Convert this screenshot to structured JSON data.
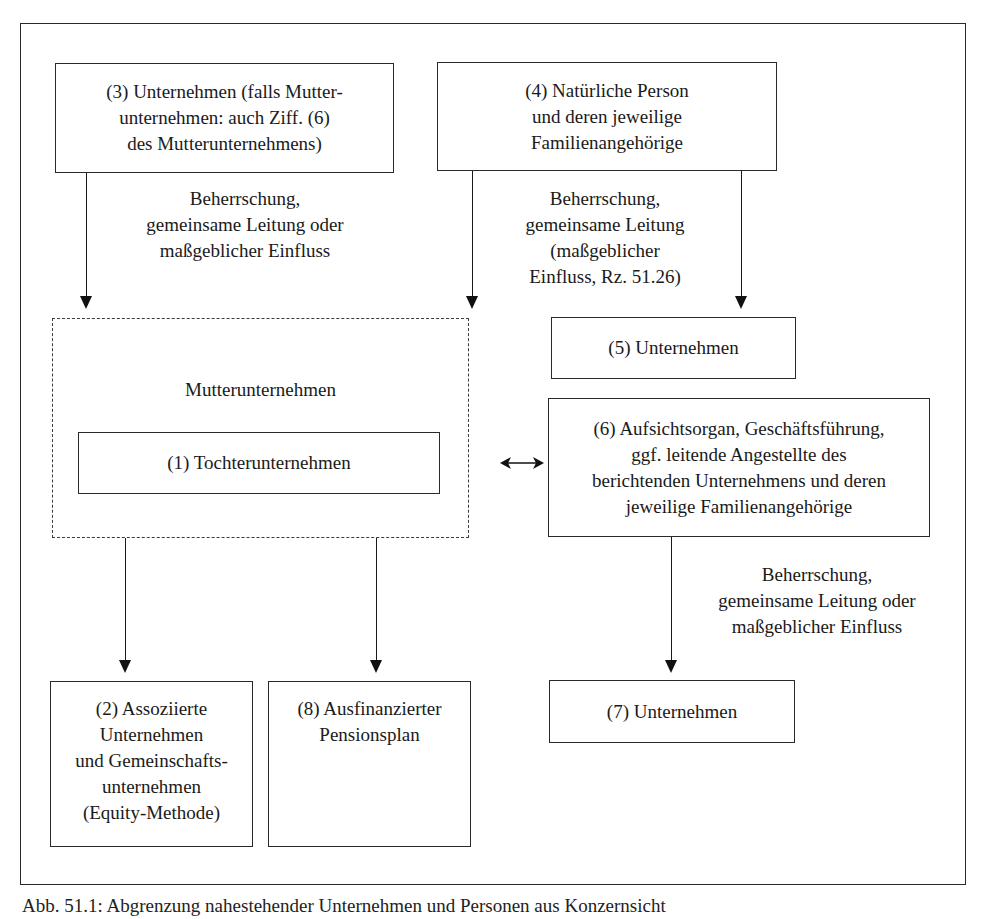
{
  "diagram": {
    "nodes": {
      "n3": {
        "text": "(3) Unternehmen (falls Mutter-\nunternehmen: auch Ziff. (6)\ndes Mutterunternehmens)"
      },
      "n4": {
        "text": "(4) Natürliche Person\nund deren jeweilige\nFamilienangehörige"
      },
      "parent": {
        "line1": "Mutterunternehmen",
        "line2_prefix": "stellt ",
        "line2_bold": "Konzernabschluss",
        "line2_suffix": " auf"
      },
      "n1": {
        "text": "(1) Tochterunternehmen"
      },
      "n5": {
        "text": "(5) Unternehmen"
      },
      "n6": {
        "text": "(6) Aufsichtsorgan, Geschäftsführung,\nggf. leitende Angestellte des\nberichtenden Unternehmens und deren\njeweilige Familienangehörige"
      },
      "n2": {
        "text": "(2) Assoziierte\nUnternehmen\nund Gemeinschafts-\nunternehmen\n(Equity-Methode)"
      },
      "n8": {
        "text": "(8) Ausfinanzierter\nPensionsplan"
      },
      "n7": {
        "text": "(7) Unternehmen"
      }
    },
    "edge_labels": {
      "from_n3": "Beherrschung,\ngemeinsame Leitung oder\nmaßgeblicher Einfluss",
      "from_n4": "Beherrschung,\ngemeinsame Leitung\n(maßgeblicher\nEinfluss, Rz. 51.26)",
      "from_n6": "Beherrschung,\ngemeinsame Leitung oder\nmaßgeblicher Einfluss"
    },
    "edges": [
      {
        "from": "n3",
        "to": "parent",
        "label": "from_n3"
      },
      {
        "from": "n4",
        "to": "parent"
      },
      {
        "from": "n4",
        "to": "n5",
        "label": "from_n4"
      },
      {
        "from": "parent",
        "to": "n6",
        "bidirectional": true
      },
      {
        "from": "n6",
        "to": "n7",
        "label": "from_n6"
      },
      {
        "from": "parent",
        "to": "n2"
      },
      {
        "from": "parent",
        "to": "n8"
      }
    ]
  },
  "caption": "Abb. 51.1: Abgrenzung nahestehender Unternehmen und Personen aus Konzernsicht"
}
